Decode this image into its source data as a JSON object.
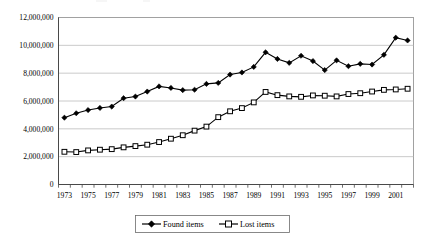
{
  "chart_data": {
    "type": "line",
    "title": "",
    "xlabel": "",
    "ylabel": "",
    "ylim": [
      0,
      12000000
    ],
    "grid": true,
    "legend_position": "bottom",
    "x": [
      1973,
      1974,
      1975,
      1976,
      1977,
      1978,
      1979,
      1980,
      1981,
      1982,
      1983,
      1984,
      1985,
      1986,
      1987,
      1988,
      1989,
      1990,
      1991,
      1992,
      1993,
      1994,
      1995,
      1996,
      1997,
      1998,
      1999,
      2000,
      2001,
      2002
    ],
    "categories": [
      "1973",
      "1974",
      "1975",
      "1976",
      "1977",
      "1978",
      "1979",
      "1980",
      "1981",
      "1982",
      "1983",
      "1984",
      "1985",
      "1986",
      "1987",
      "1988",
      "1989",
      "1990",
      "1991",
      "1992",
      "1993",
      "1994",
      "1995",
      "1996",
      "1997",
      "1998",
      "1999",
      "2000",
      "2001",
      "2002"
    ],
    "xtick_labels": [
      "1973",
      "1975",
      "1977",
      "1979",
      "1981",
      "1983",
      "1985",
      "1987",
      "1989",
      "1991",
      "1993",
      "1995",
      "1997",
      "1999",
      "2001"
    ],
    "ytick_labels": [
      "0",
      "2,000,000",
      "4,000,000",
      "6,000,000",
      "8,000,000",
      "10,000,000",
      "12,000,000"
    ],
    "ytick_values": [
      0,
      2000000,
      4000000,
      6000000,
      8000000,
      10000000,
      12000000
    ],
    "series": [
      {
        "name": "Found items",
        "marker": "filled-diamond",
        "color": "#000000",
        "values": [
          4800000,
          5120000,
          5350000,
          5500000,
          5600000,
          6200000,
          6320000,
          6680000,
          7050000,
          6940000,
          6780000,
          6810000,
          7230000,
          7300000,
          7900000,
          8050000,
          8450000,
          9500000,
          9020000,
          8740000,
          9250000,
          8870000,
          8220000,
          8920000,
          8500000,
          8670000,
          8620000,
          9320000,
          10550000,
          10350000
        ]
      },
      {
        "name": "Lost items",
        "marker": "open-square",
        "color": "#000000",
        "values": [
          2350000,
          2330000,
          2450000,
          2500000,
          2540000,
          2670000,
          2760000,
          2860000,
          3050000,
          3290000,
          3540000,
          3870000,
          4160000,
          4840000,
          5260000,
          5490000,
          5900000,
          6650000,
          6420000,
          6330000,
          6300000,
          6400000,
          6380000,
          6330000,
          6500000,
          6560000,
          6680000,
          6800000,
          6830000,
          6880000
        ]
      }
    ]
  },
  "legend": {
    "entries": [
      {
        "label": "Found items",
        "marker": "filled-diamond"
      },
      {
        "label": "Lost items",
        "marker": "open-square"
      }
    ]
  }
}
